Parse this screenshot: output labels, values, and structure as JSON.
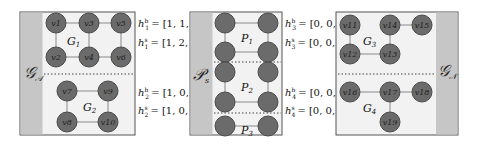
{
  "colors": {
    "panel_bg": "#f2f2f2",
    "strip": "#c6c6c6",
    "border": "#555555",
    "node_fill": "#6b6b6b",
    "node_stroke": "#4a4a4a",
    "edge": "#8a8a8a",
    "divider": "#444444"
  },
  "panels": [
    {
      "id": "left",
      "side_label": "𝒢𝒜",
      "side_label_text": "G_A",
      "strip_position": "left",
      "subgraphs": [
        {
          "label": "G1",
          "nodes": [
            "v1",
            "v2",
            "v3",
            "v4",
            "v5",
            "v6"
          ],
          "edges": [
            [
              "v1",
              "v3"
            ],
            [
              "v3",
              "v5"
            ],
            [
              "v1",
              "v2"
            ],
            [
              "v3",
              "v4"
            ],
            [
              "v2",
              "v4"
            ],
            [
              "v4",
              "v6"
            ],
            [
              "v5",
              "v6"
            ]
          ]
        },
        {
          "label": "G2",
          "nodes": [
            "v7",
            "v8",
            "v9",
            "v10"
          ],
          "edges": [
            [
              "v7",
              "v9"
            ],
            [
              "v7",
              "v8"
            ],
            [
              "v9",
              "v10"
            ],
            [
              "v8",
              "v10"
            ]
          ]
        }
      ]
    },
    {
      "id": "middle",
      "side_label": "𝒫s",
      "side_label_text": "P_s",
      "strip_position": "left",
      "subgraphs": [
        {
          "label": "P1"
        },
        {
          "label": "P2"
        },
        {
          "label": "P3"
        }
      ]
    },
    {
      "id": "right",
      "side_label": "𝒢𝒩",
      "side_label_text": "G_N",
      "strip_position": "right",
      "subgraphs": [
        {
          "label": "G3",
          "nodes": [
            "v11",
            "v12",
            "v13",
            "v14",
            "v15"
          ],
          "edges": [
            [
              "v11",
              "v12"
            ],
            [
              "v12",
              "v13"
            ],
            [
              "v13",
              "v14"
            ],
            [
              "v14",
              "v15"
            ]
          ]
        },
        {
          "label": "G4",
          "nodes": [
            "v16",
            "v17",
            "v18",
            "v19"
          ],
          "edges": [
            [
              "v16",
              "v17"
            ],
            [
              "v17",
              "v18"
            ],
            [
              "v17",
              "v19"
            ]
          ]
        }
      ]
    }
  ],
  "equations_left": [
    {
      "sym": "h",
      "sup": "b",
      "sub": "1",
      "value": "= [1, 1, 1]"
    },
    {
      "sym": "h",
      "sup": "s",
      "sub": "1",
      "value": "= [1, 2, 6]"
    },
    {
      "sym": "h",
      "sup": "b",
      "sub": "2",
      "value": "= [1, 0, 1]"
    },
    {
      "sym": "h",
      "sup": "s",
      "sub": "2",
      "value": "= [1, 0, 4]"
    }
  ],
  "equations_right": [
    {
      "sym": "h",
      "sup": "b",
      "sub": "3",
      "value": "= [0, 0, 1]"
    },
    {
      "sym": "h",
      "sup": "s",
      "sub": "3",
      "value": "= [0, 0, 1]"
    },
    {
      "sym": "h",
      "sup": "b",
      "sub": "4",
      "value": "= [0, 0, 1]"
    },
    {
      "sym": "h",
      "sup": "s",
      "sub": "4",
      "value": "= [0, 0, 2]"
    }
  ],
  "labels": {
    "v1": "v1",
    "v2": "v2",
    "v3": "v3",
    "v4": "v4",
    "v5": "v5",
    "v6": "v6",
    "v7": "v7",
    "v8": "v8",
    "v9": "v9",
    "v10": "v10",
    "v11": "v11",
    "v12": "v12",
    "v13": "v13",
    "v14": "v14",
    "v15": "v15",
    "v16": "v16",
    "v17": "v17",
    "v18": "v18",
    "v19": "v19",
    "G1": "G",
    "G1_sub": "1",
    "G2": "G",
    "G2_sub": "2",
    "G3": "G",
    "G3_sub": "3",
    "G4": "G",
    "G4_sub": "4",
    "P1": "P",
    "P1_sub": "1",
    "P2": "P",
    "P2_sub": "2",
    "P3": "P",
    "P3_sub": "3",
    "GA": "𝒢",
    "GA_sub": "𝒜",
    "Ps": "𝒫",
    "Ps_sub": "s",
    "GN": "𝒢",
    "GN_sub": "𝒩"
  }
}
